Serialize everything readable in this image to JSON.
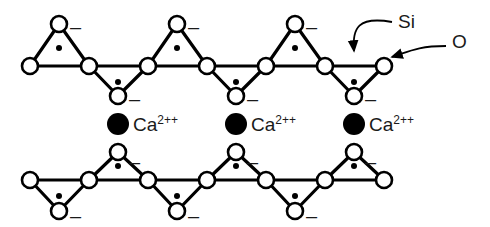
{
  "figure": {
    "type": "chemical-structure-diagram",
    "width": 490,
    "height": 227,
    "background_color": "#ffffff",
    "stroke_color": "#000000"
  },
  "legend": {
    "silicon": {
      "label": "Si",
      "glyph": "filled-small-dot",
      "label_x": 398,
      "label_y": 12,
      "arrow_target_x": 354,
      "arrow_target_y": 63
    },
    "oxygen": {
      "label": "O",
      "glyph": "open-circle",
      "label_x": 452,
      "label_y": 32,
      "arrow_target_x": 392,
      "arrow_target_y": 57
    }
  },
  "ions": {
    "label": "Ca",
    "charge": "2++",
    "glyph": "filled-large-circle",
    "color": "#000000",
    "radius": 11,
    "items": [
      {
        "cx": 118,
        "cy": 124,
        "label_x": 133,
        "label_y": 115
      },
      {
        "cx": 236,
        "cy": 124,
        "label_x": 251,
        "label_y": 115
      },
      {
        "cx": 354,
        "cy": 124,
        "label_x": 369,
        "label_y": 115
      }
    ]
  },
  "charges": {
    "symbol": "–",
    "positions": [
      {
        "x": 70,
        "y": 17
      },
      {
        "x": 188,
        "y": 17
      },
      {
        "x": 306,
        "y": 17
      },
      {
        "x": 129,
        "y": 89
      },
      {
        "x": 247,
        "y": 89
      },
      {
        "x": 365,
        "y": 89
      },
      {
        "x": 129,
        "y": 152
      },
      {
        "x": 247,
        "y": 152
      },
      {
        "x": 365,
        "y": 152
      },
      {
        "x": 70,
        "y": 206
      },
      {
        "x": 188,
        "y": 206
      },
      {
        "x": 306,
        "y": 206
      }
    ]
  },
  "chains": [
    {
      "name": "upper-silicate-chain",
      "baseline_y": 66,
      "apex_up_y": 24,
      "apex_down_y": 96,
      "baseline_nodes_x": [
        30,
        89,
        148,
        207,
        266,
        325,
        384
      ],
      "apex_up_x": [
        59,
        177,
        295
      ],
      "apex_down_x": [
        118,
        236,
        354
      ],
      "tetrahedra": [
        {
          "apex": "up",
          "cx": 59,
          "cy": 24,
          "si_x": 59,
          "si_y": 48
        },
        {
          "apex": "down",
          "cx": 118,
          "cy": 96,
          "si_x": 118,
          "si_y": 82
        },
        {
          "apex": "up",
          "cx": 177,
          "cy": 24,
          "si_x": 177,
          "si_y": 48
        },
        {
          "apex": "down",
          "cx": 236,
          "cy": 96,
          "si_x": 236,
          "si_y": 82
        },
        {
          "apex": "up",
          "cx": 295,
          "cy": 24,
          "si_x": 295,
          "si_y": 48
        },
        {
          "apex": "down",
          "cx": 354,
          "cy": 96,
          "si_x": 354,
          "si_y": 82
        }
      ]
    },
    {
      "name": "lower-silicate-chain",
      "baseline_y": 180,
      "apex_up_y": 152,
      "apex_down_y": 211,
      "baseline_nodes_x": [
        30,
        89,
        148,
        207,
        266,
        325,
        384
      ],
      "apex_up_x": [
        118,
        236,
        354
      ],
      "apex_down_x": [
        59,
        177,
        295
      ],
      "tetrahedra": [
        {
          "apex": "down",
          "cx": 59,
          "cy": 211,
          "si_x": 59,
          "si_y": 196
        },
        {
          "apex": "up",
          "cx": 118,
          "cy": 152,
          "si_x": 118,
          "si_y": 166
        },
        {
          "apex": "down",
          "cx": 177,
          "cy": 211,
          "si_x": 177,
          "si_y": 196
        },
        {
          "apex": "up",
          "cx": 236,
          "cy": 152,
          "si_x": 236,
          "si_y": 166
        },
        {
          "apex": "down",
          "cx": 295,
          "cy": 211,
          "si_x": 295,
          "si_y": 196
        },
        {
          "apex": "up",
          "cx": 354,
          "cy": 152,
          "si_x": 354,
          "si_y": 166
        }
      ]
    }
  ],
  "style": {
    "oxygen_radius": 8,
    "silicon_dot_radius": 3,
    "bond_width": 3.2
  }
}
